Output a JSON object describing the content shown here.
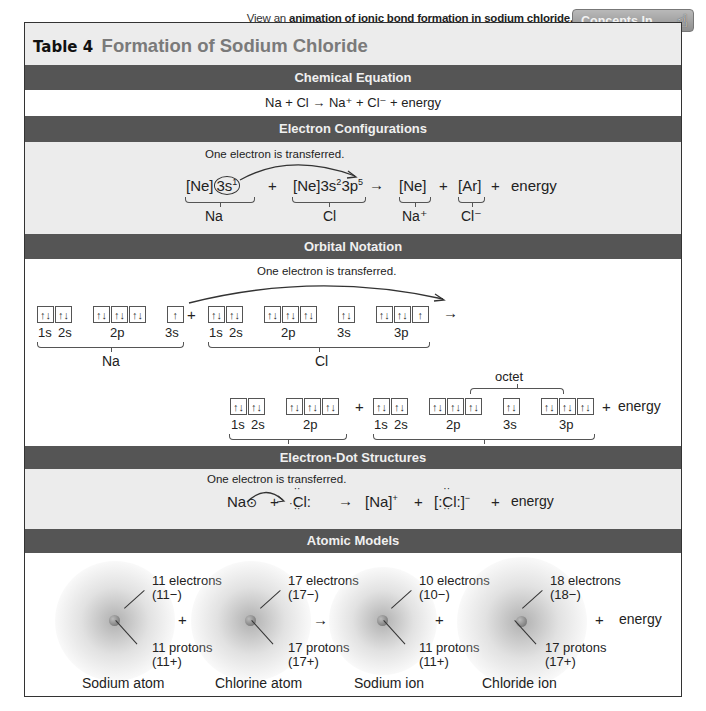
{
  "header": {
    "link_prefix": "View an",
    "link_text": "animation of ionic bond formation in sodium chloride.",
    "button_label": "Concepts In Motion",
    "button_icon": "hand-pointer-icon"
  },
  "table": {
    "number": "Table 4",
    "title": "Formation of Sodium Chloride"
  },
  "sections": {
    "chemical_equation": {
      "heading": "Chemical Equation",
      "equation": "Na + Cl → Na⁺ + Cl⁻ + energy"
    },
    "electron_configurations": {
      "heading": "Electron Configurations",
      "note": "One electron is transferred.",
      "na_config_prefix": "[Ne]",
      "na_config_circled": "3s",
      "na_config_circled_sup": "1",
      "plus": "+",
      "cl_config": "[Ne]3s",
      "cl_sup1": "2",
      "cl_mid": "3p",
      "cl_sup2": "5",
      "arrow": "→",
      "na_ion_config": "[Ne]",
      "cl_ion_config": "[Ar]",
      "energy": "energy",
      "labels": {
        "na": "Na",
        "cl": "Cl",
        "na_ion": "Na⁺",
        "cl_ion": "Cl⁻"
      }
    },
    "orbital_notation": {
      "heading": "Orbital Notation",
      "note": "One electron is transferred.",
      "pair": "↑↓",
      "single": "↑",
      "plus": "+",
      "arrow": "→",
      "energy": "energy",
      "octet": "octet",
      "orbital_labels": {
        "s1": "1s",
        "s2": "2s",
        "p2": "2p",
        "s3": "3s",
        "p3": "3p"
      },
      "labels": {
        "na": "Na",
        "cl": "Cl",
        "na_ion": "Na⁺",
        "cl_ion": "Cl⁻"
      }
    },
    "electron_dot": {
      "heading": "Electron-Dot Structures",
      "note": "One electron is transferred.",
      "na": "Na",
      "plus": "+",
      "cl": "Cl",
      "arrow": "→",
      "na_ion": "[Na]",
      "na_ion_sup": "+",
      "cl_ion_open": "[:",
      "cl_ion_close": ":]",
      "cl_ion_sup": "−",
      "energy": "energy"
    },
    "atomic_models": {
      "heading": "Atomic Models",
      "plus": "+",
      "arrow": "→",
      "energy": "energy",
      "models": [
        {
          "name": "Sodium atom",
          "electrons": "11 electrons",
          "electron_charge": "(11−)",
          "protons": "11 protons",
          "proton_charge": "(11+)"
        },
        {
          "name": "Chlorine atom",
          "electrons": "17 electrons",
          "electron_charge": "(17−)",
          "protons": "17 protons",
          "proton_charge": "(17+)"
        },
        {
          "name": "Sodium ion",
          "electrons": "10 electrons",
          "electron_charge": "(10−)",
          "protons": "11 protons",
          "proton_charge": "(11+)"
        },
        {
          "name": "Chloride ion",
          "electrons": "18 electrons",
          "electron_charge": "(18−)",
          "protons": "17 protons",
          "proton_charge": "(17+)"
        }
      ]
    }
  }
}
